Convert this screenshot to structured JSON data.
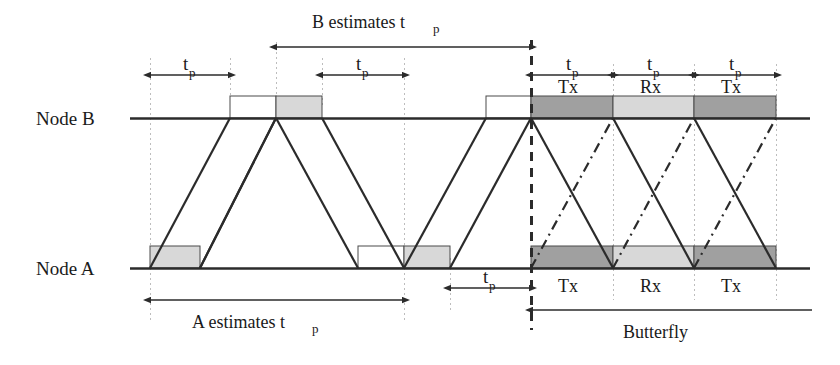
{
  "figure": {
    "type": "timing-diagram",
    "title": "",
    "axes": {
      "node_b_label": "Node B",
      "node_a_label": "Node A"
    },
    "symbols": {
      "tp_base": "t",
      "tp_sub": "p"
    },
    "annotations": {
      "b_estimates": "B estimates t",
      "b_estimates_sub": "p",
      "a_estimates": "A estimates t",
      "a_estimates_sub": "p",
      "butterfly": "Butterfly"
    },
    "slot_labels": {
      "tx": "Tx",
      "rx": "Rx"
    },
    "butterfly_slots": [
      {
        "label": "Tx",
        "shade": "dark"
      },
      {
        "label": "Rx",
        "shade": "light"
      },
      {
        "label": "Tx",
        "shade": "dark"
      }
    ],
    "node_b_butterfly_slots": [
      {
        "label": "Tx",
        "shade": "dark"
      },
      {
        "label": "Rx",
        "shade": "light"
      },
      {
        "label": "Tx",
        "shade": "dark"
      }
    ],
    "node_a_butterfly_slots": [
      {
        "label": "Tx",
        "shade": "dark"
      },
      {
        "label": "Rx",
        "shade": "light"
      },
      {
        "label": "Tx",
        "shade": "dark"
      }
    ],
    "tp_markers_top": [
      {
        "id": "tp-1",
        "x_from": 150,
        "x_to": 230
      },
      {
        "id": "tp-2",
        "x_from": 322,
        "x_to": 404
      }
    ],
    "tp_markers_butterfly": [
      {
        "id": "tp-b1",
        "x_from": 531,
        "x_to": 613
      },
      {
        "id": "tp-b2",
        "x_from": 613,
        "x_to": 694
      },
      {
        "id": "tp-b3",
        "x_from": 694,
        "x_to": 776
      }
    ],
    "tp_marker_bottom": {
      "id": "tp-bottom",
      "x_from": 450,
      "x_to": 531
    },
    "colors": {
      "line": "#2b2b2b",
      "grid": "#b8b8b8",
      "block_light": "#d8d8d8",
      "block_dark": "#a0a0a0",
      "block_white": "#ffffff",
      "text": "#1a1a1a",
      "background": "#ffffff"
    },
    "geometry": {
      "node_b_y": 118,
      "node_a_y": 268,
      "block_height": 22,
      "canvas_width": 840,
      "canvas_height": 365
    }
  }
}
